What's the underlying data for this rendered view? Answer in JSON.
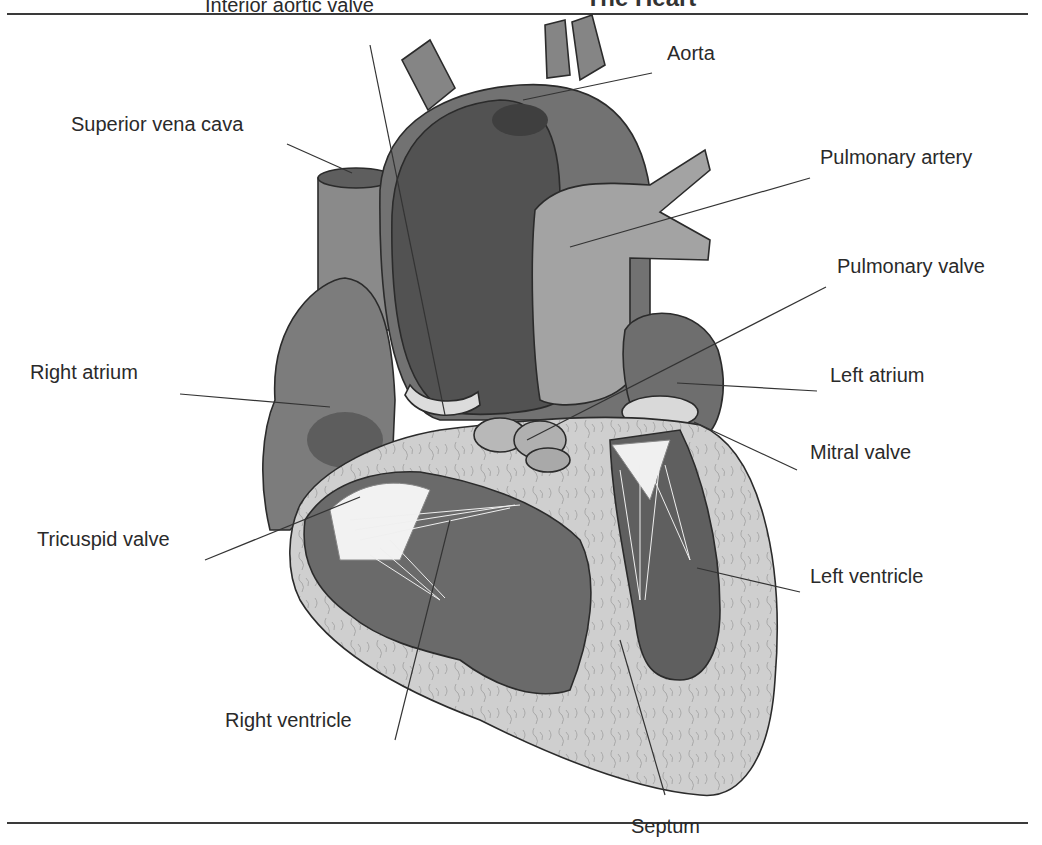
{
  "figure": {
    "title": "The Heart",
    "title_visible_fragment": "The Heart (cropped at top edge)"
  },
  "colors": {
    "outline": "#2b2b2b",
    "dark_chamber": "#5a5a5a",
    "mid_chamber": "#7a7a7a",
    "light_tissue": "#c9c9c9",
    "vessel": "#8d8d8d",
    "pale": "#e4e4e4",
    "leader": "#333333"
  },
  "labels": [
    {
      "id": "interior-aortic-valve",
      "text": "Interior aortic valve",
      "x": 205,
      "y": 12,
      "line": [
        370,
        45,
        445,
        415
      ]
    },
    {
      "id": "aorta",
      "text": "Aorta",
      "x": 667,
      "y": 60,
      "line": [
        652,
        73,
        523,
        100
      ]
    },
    {
      "id": "superior-vena-cava",
      "text": "Superior vena cava",
      "x": 71,
      "y": 131,
      "line": [
        287,
        144,
        352,
        173
      ]
    },
    {
      "id": "pulmonary-artery",
      "text": "Pulmonary artery",
      "x": 820,
      "y": 164,
      "line": [
        810,
        178,
        570,
        247
      ]
    },
    {
      "id": "pulmonary-valve",
      "text": "Pulmonary valve",
      "x": 837,
      "y": 273,
      "line": [
        826,
        287,
        527,
        440
      ]
    },
    {
      "id": "right-atrium",
      "text": "Right atrium",
      "x": 30,
      "y": 379,
      "line": [
        180,
        394,
        330,
        407
      ]
    },
    {
      "id": "left-atrium",
      "text": "Left atrium",
      "x": 830,
      "y": 382,
      "line": [
        817,
        391,
        677,
        383
      ]
    },
    {
      "id": "mitral-valve",
      "text": "Mitral valve",
      "x": 810,
      "y": 459,
      "line": [
        797,
        470,
        694,
        422
      ]
    },
    {
      "id": "tricuspid-valve",
      "text": "Tricuspid valve",
      "x": 37,
      "y": 546,
      "line": [
        205,
        560,
        360,
        497
      ]
    },
    {
      "id": "left-ventricle",
      "text": "Left ventricle",
      "x": 810,
      "y": 583,
      "line": [
        800,
        592,
        697,
        568
      ]
    },
    {
      "id": "right-ventricle",
      "text": "Right ventricle",
      "x": 225,
      "y": 727,
      "line": [
        395,
        740,
        450,
        520
      ]
    },
    {
      "id": "septum",
      "text": "Septum",
      "x": 631,
      "y": 833,
      "line": [
        665,
        795,
        620,
        640
      ]
    }
  ]
}
